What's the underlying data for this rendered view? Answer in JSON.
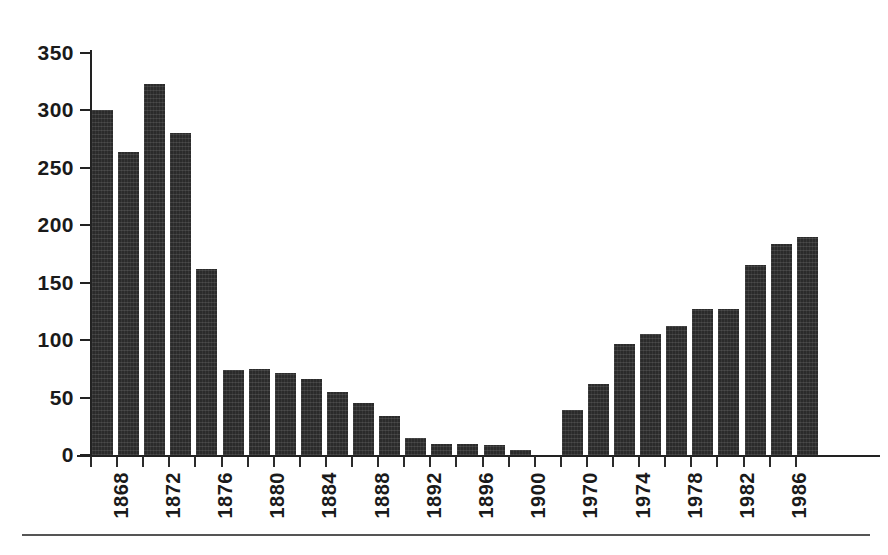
{
  "chart_data": {
    "type": "bar",
    "title": "",
    "subtitle": "",
    "xlabel": "",
    "ylabel": "",
    "ylim": [
      0,
      350
    ],
    "yticks": [
      0,
      50,
      100,
      150,
      200,
      250,
      300,
      350
    ],
    "grid": false,
    "legend": null,
    "bar_color": "#2b2b2b",
    "axis_color": "#222222",
    "background": "#ffffff",
    "x_tick_label_rotation": 90,
    "x_tick_label_interval": 2,
    "note": "Two year groups separated by a blank slot: 1868-1900 and 1970-1988",
    "categories": [
      "1868",
      "1870",
      "1872",
      "1874",
      "1876",
      "1878",
      "1880",
      "1882",
      "1884",
      "1886",
      "1888",
      "1890",
      "1892",
      "1894",
      "1896",
      "1898",
      "1900",
      "",
      "1970",
      "1972",
      "1974",
      "1976",
      "1978",
      "1980",
      "1982",
      "1984",
      "1986",
      "1988"
    ],
    "values": [
      300,
      264,
      323,
      280,
      162,
      74,
      75,
      71,
      66,
      55,
      45,
      34,
      15,
      10,
      10,
      9,
      4,
      null,
      39,
      62,
      97,
      105,
      112,
      127,
      127,
      165,
      184,
      190
    ],
    "tick_labels_shown": [
      "1868",
      "1872",
      "1876",
      "1880",
      "1884",
      "1888",
      "1892",
      "1896",
      "1900",
      "1970",
      "1974",
      "1978",
      "1982",
      "1986"
    ]
  }
}
